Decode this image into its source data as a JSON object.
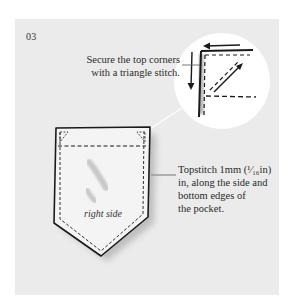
{
  "step": {
    "number": "03"
  },
  "callouts": {
    "top_corners": {
      "lines": [
        "Secure the top corners",
        "with a triangle stitch."
      ]
    },
    "topstitch": {
      "lines": [
        "Topstitch 1mm (¹⁄₁₆in)",
        "in, along the side and",
        "bottom edges of",
        "the pocket."
      ]
    }
  },
  "illustration": {
    "pocket_label": "right side",
    "detail_view": "magnified-corner-circle"
  },
  "colors": {
    "panel": "#ebebeb",
    "ink": "#1a1a1a",
    "detail_circle": "#ffffff",
    "pocket_fill": "#f4f4f4"
  }
}
